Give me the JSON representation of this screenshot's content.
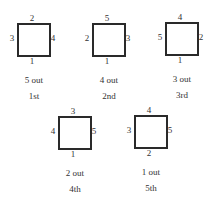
{
  "figures": [
    {
      "top": "2",
      "left": "3",
      "right": "4",
      "bottom": "1",
      "caption": "5 out",
      "order": "1st"
    },
    {
      "top": "5",
      "left": "2",
      "right": "3",
      "bottom": "1",
      "caption": "4 out",
      "order": "2nd"
    },
    {
      "top": "4",
      "left": "5",
      "right": "2",
      "bottom": "1",
      "caption": "3 out",
      "order": "3rd"
    },
    {
      "top": "3",
      "left": "4",
      "right": "5",
      "bottom": "1",
      "caption": "2 out",
      "order": "4th"
    },
    {
      "top": "4",
      "left": "3",
      "right": "5",
      "bottom": "2",
      "caption": "1 out",
      "order": "5th"
    }
  ]
}
